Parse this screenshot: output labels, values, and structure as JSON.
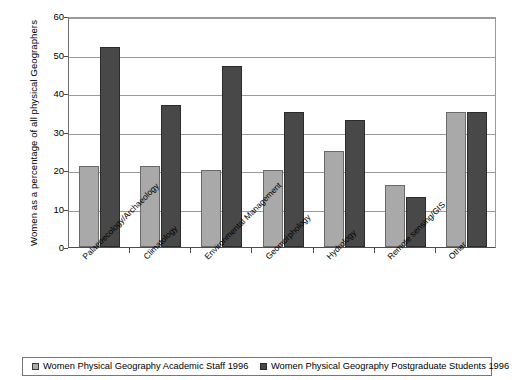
{
  "chart_data": {
    "type": "bar",
    "title": "",
    "xlabel": "",
    "ylabel": "Women as a percentage of all physical Geographers",
    "ylim": [
      0,
      60
    ],
    "yticks": [
      0,
      10,
      20,
      30,
      40,
      50,
      60
    ],
    "grid": true,
    "legend_position": "bottom",
    "categories": [
      "Palaeoecology/Archaeology",
      "Climatology",
      "Environmental Management",
      "Geomorphology",
      "Hydrology",
      "Remote sensing/GIS",
      "Other"
    ],
    "series": [
      {
        "name": "Women Physical Geography Academic Staff 1996",
        "color": "#a9a9a9",
        "values": [
          21,
          21,
          20,
          20,
          25,
          16,
          35
        ]
      },
      {
        "name": "Women Physical Geography Postgraduate Students 1996",
        "color": "#484848",
        "values": [
          52,
          37,
          47,
          35,
          33,
          13,
          35
        ]
      }
    ]
  },
  "legend": {
    "entries": [
      {
        "label": "Women Physical Geography Academic Staff 1996",
        "marker": "light-square-icon"
      },
      {
        "label": "Women Physical Geography Postgraduate Students 1996",
        "marker": "dark-square-icon"
      }
    ]
  }
}
